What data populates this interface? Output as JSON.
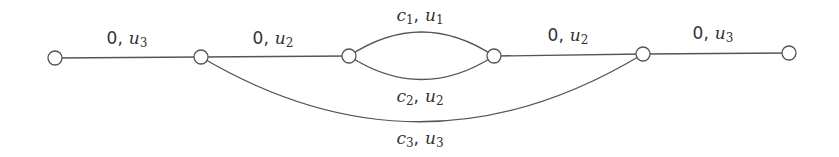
{
  "diagram": {
    "title": "",
    "stroke_color": "#555555",
    "text_color": "#333333",
    "nodes": [
      {
        "id": "n1",
        "x": 55,
        "y": 58
      },
      {
        "id": "n2",
        "x": 201,
        "y": 57
      },
      {
        "id": "n3",
        "x": 349,
        "y": 56
      },
      {
        "id": "n4",
        "x": 494,
        "y": 56
      },
      {
        "id": "n5",
        "x": 643,
        "y": 54
      },
      {
        "id": "n6",
        "x": 789,
        "y": 53
      }
    ],
    "edges": [
      {
        "id": "e1",
        "from": "n1",
        "to": "n2",
        "shape": "straight",
        "label": {
          "cost": "0",
          "sep": ",",
          "cap_var": "u",
          "cap_sub": "3",
          "x": 127,
          "y": 38
        }
      },
      {
        "id": "e2",
        "from": "n2",
        "to": "n3",
        "shape": "straight",
        "label": {
          "cost": "0",
          "sep": ",",
          "cap_var": "u",
          "cap_sub": "2",
          "x": 273,
          "y": 38
        }
      },
      {
        "id": "e3",
        "from": "n3",
        "to": "n4",
        "shape": "arc-up",
        "label": {
          "cost_var": "c",
          "cost_sub": "1",
          "sep": ",",
          "cap_var": "u",
          "cap_sub": "1",
          "x": 420,
          "y": 15
        }
      },
      {
        "id": "e4",
        "from": "n3",
        "to": "n4",
        "shape": "arc-down",
        "label": {
          "cost_var": "c",
          "cost_sub": "2",
          "sep": ",",
          "cap_var": "u",
          "cap_sub": "2",
          "x": 420,
          "y": 96
        }
      },
      {
        "id": "e5",
        "from": "n4",
        "to": "n5",
        "shape": "straight",
        "label": {
          "cost": "0",
          "sep": ",",
          "cap_var": "u",
          "cap_sub": "2",
          "x": 568,
          "y": 35
        }
      },
      {
        "id": "e6",
        "from": "n5",
        "to": "n6",
        "shape": "straight",
        "label": {
          "cost": "0",
          "sep": ",",
          "cap_var": "u",
          "cap_sub": "3",
          "x": 713,
          "y": 33
        }
      },
      {
        "id": "e7",
        "from": "n2",
        "to": "n5",
        "shape": "arc-down-wide",
        "label": {
          "cost_var": "c",
          "cost_sub": "3",
          "sep": ",",
          "cap_var": "u",
          "cap_sub": "3",
          "x": 420,
          "y": 138
        }
      }
    ]
  }
}
